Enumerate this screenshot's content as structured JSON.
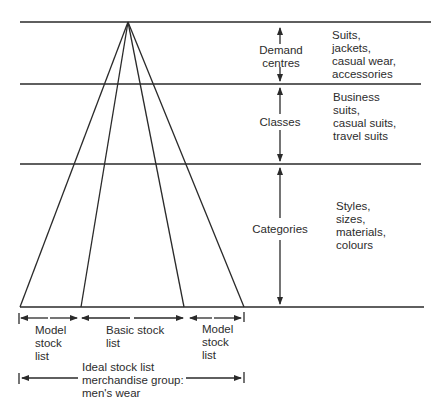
{
  "diagram": {
    "type": "stock-list hierarchy fan diagram",
    "levels": [
      {
        "label": "Demand centres",
        "examples": "Suits,\njackets,\ncasual wear,\naccessories"
      },
      {
        "label": "Classes",
        "examples": "Business\nsuits,\ncasual suits,\ntravel suits"
      },
      {
        "label": "Categories",
        "examples": "Styles,\nsizes,\nmaterials,\ncolours"
      }
    ],
    "level_labels": {
      "demand_centres": "Demand\ncentres",
      "classes": "Classes",
      "categories": "Categories"
    },
    "bottom_segments": [
      {
        "label": "Model\nstock\nlist"
      },
      {
        "label": "Basic stock\nlist"
      },
      {
        "label": "Model\nstock\nlist"
      }
    ],
    "span_label": "Ideal stock list\nmerchandise group:\nmen's wear",
    "colors": {
      "line": "#2a2a2a",
      "text": "#2c2c2c",
      "background": "#ffffff"
    }
  }
}
